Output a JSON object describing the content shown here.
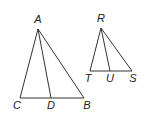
{
  "figure": {
    "triangle_abc": {
      "vertices": {
        "A": [
          38,
          29
        ],
        "B": [
          84,
          98
        ],
        "C": [
          20,
          98
        ],
        "D": [
          51,
          98
        ]
      },
      "labels": {
        "A": "A",
        "B": "B",
        "C": "C",
        "D": "D"
      },
      "label_positions": {
        "A": [
          38,
          22
        ],
        "B": [
          87,
          109
        ],
        "C": [
          17,
          109
        ],
        "D": [
          51,
          109
        ]
      },
      "segments": [
        [
          "A",
          "C"
        ],
        [
          "A",
          "B"
        ],
        [
          "C",
          "B"
        ],
        [
          "A",
          "D"
        ]
      ]
    },
    "triangle_rst": {
      "vertices": {
        "R": [
          101,
          28
        ],
        "S": [
          132,
          71
        ],
        "T": [
          90,
          71
        ],
        "U": [
          110,
          71
        ]
      },
      "labels": {
        "R": "R",
        "S": "S",
        "T": "T",
        "U": "U"
      },
      "label_positions": {
        "R": [
          101,
          21
        ],
        "S": [
          133,
          82
        ],
        "T": [
          88,
          82
        ],
        "U": [
          110,
          82
        ]
      },
      "segments": [
        [
          "R",
          "T"
        ],
        [
          "R",
          "S"
        ],
        [
          "T",
          "S"
        ],
        [
          "R",
          "U"
        ]
      ]
    }
  }
}
